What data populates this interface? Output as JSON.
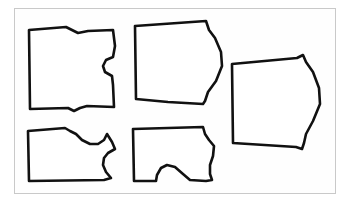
{
  "canvas": {
    "width": 350,
    "height": 208,
    "background_color": "#ffffff",
    "inner_background_color": "#fefefe"
  },
  "frame": {
    "name": "image-border",
    "x": 14,
    "y": 8,
    "width": 322,
    "height": 186,
    "border_color": "#c9c9c9",
    "border_width": 1
  },
  "drawing": {
    "title": "",
    "description": "Hand-drawn line art of five garment pattern pieces arranged in two rows inside a thin rectangular frame.",
    "stroke_color": "#111111",
    "fill_color": "#ffffff",
    "piece_count": 5
  },
  "pieces": [
    {
      "id": "piece-top-left",
      "label": "top-left-panel",
      "row": "top",
      "column": 1,
      "stroke_width": 2.6,
      "path": "M 29 30 L 66 27 L 72 30 L 78 33 L 88 31 L 113 30 L 115 46 L 113 57 L 106 60 L 103 66 L 105 72 L 112 76 L 113 85 L 114 107 L 87 106 L 80 108 L 74 111 L 68 108 L 30 109 Z"
    },
    {
      "id": "piece-top-middle",
      "label": "top-middle-panel",
      "row": "top",
      "column": 2,
      "stroke_width": 2.6,
      "path": "M 135 26 L 206 21 L 209 30 L 215 38 L 221 52 L 222 66 L 216 81 L 208 92 L 205 101 L 203 104 L 168 102 L 136 99 Z"
    },
    {
      "id": "piece-right",
      "label": "right-panel",
      "row": "top",
      "column": 3,
      "stroke_width": 2.6,
      "path": "M 232 64 L 297 58 L 303 55 L 306 62 L 313 72 L 319 88 L 320 104 L 313 121 L 306 134 L 304 143 L 302 149 L 296 147 L 233 143 Z"
    },
    {
      "id": "piece-bottom-left",
      "label": "bottom-left-panel",
      "row": "bottom",
      "column": 1,
      "stroke_width": 2.6,
      "path": "M 28 131 L 65 128 L 70 131 L 76 134 L 82 140 L 90 144 L 98 144 L 104 140 L 107 134 L 112 142 L 115 149 L 108 153 L 104 158 L 103 165 L 106 172 L 111 178 L 104 180 L 29 181 Z"
    },
    {
      "id": "piece-bottom-middle",
      "label": "bottom-middle-panel",
      "row": "bottom",
      "column": 2,
      "stroke_width": 2.6,
      "path": "M 133 129 L 203 127 L 205 134 L 209 140 L 214 146 L 213 156 L 210 165 L 210 174 L 212 180 L 206 181 L 190 180 L 183 174 L 175 167 L 167 165 L 161 168 L 157 175 L 156 181 L 134 181 Z"
    }
  ]
}
